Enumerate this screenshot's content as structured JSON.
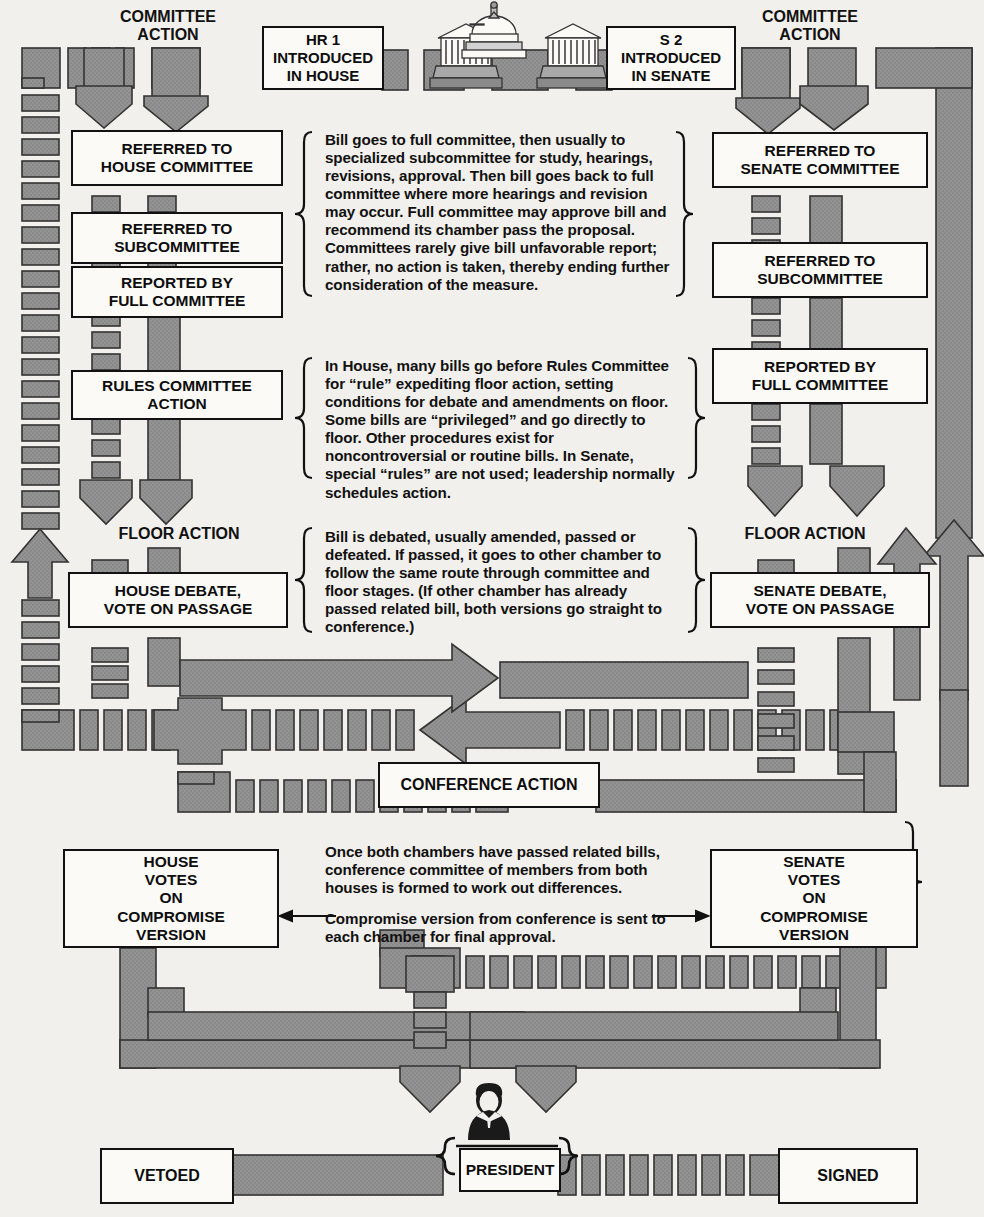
{
  "diagram": {
    "colors": {
      "track": "#8f8f8f",
      "track_stroke": "#3a3a3a",
      "box_fill": "#fbfaf7",
      "box_stroke": "#111111",
      "page": "#f2f0ec"
    }
  },
  "labels": {
    "committee_action_left": "COMMITTEE\nACTION",
    "committee_action_right": "COMMITTEE\nACTION",
    "floor_action_left": "FLOOR ACTION",
    "floor_action_right": "FLOOR ACTION"
  },
  "boxes": {
    "hr1": "HR 1\nINTRODUCED\nIN HOUSE",
    "s2": "S 2\nINTRODUCED\nIN SENATE",
    "referred_house_committee": "REFERRED TO\nHOUSE COMMITTEE",
    "referred_subcommittee_house": "REFERRED TO\nSUBCOMMITTEE",
    "reported_full_committee_house": "REPORTED BY\nFULL COMMITTEE",
    "rules_committee_action": "RULES COMMITTEE\nACTION",
    "house_debate": "HOUSE DEBATE,\nVOTE ON PASSAGE",
    "referred_senate_committee": "REFERRED TO\nSENATE COMMITTEE",
    "referred_subcommittee_senate": "REFERRED TO\nSUBCOMMITTEE",
    "reported_full_committee_senate": "REPORTED BY\nFULL COMMITTEE",
    "senate_debate": "SENATE DEBATE,\nVOTE ON PASSAGE",
    "conference_action": "CONFERENCE ACTION",
    "house_votes_compromise": "HOUSE\nVOTES\nON\nCOMPROMISE\nVERSION",
    "senate_votes_compromise": "SENATE\nVOTES\nON\nCOMPROMISE\nVERSION",
    "president": "PRESIDENT",
    "vetoed": "VETOED",
    "signed": "SIGNED"
  },
  "notes": {
    "committee": "Bill goes to full committee, then usually to specialized subcommittee for study, hearings, revisions, approval. Then bill goes back to full committee where more hearings and revision may occur. Full committee may approve bill and recommend its chamber pass the proposal. Committees rarely give bill unfavorable report; rather, no action is taken, thereby ending further consideration of the measure.",
    "rules": "In House, many bills go before Rules Committee for “rule” expediting floor action, setting conditions for debate and amendments on floor. Some bills are “privileged” and go directly to floor. Other procedures exist for noncontroversial or routine bills. In Senate, special “rules” are not used; leadership normally schedules action.",
    "floor": "Bill is debated, usually amended, passed or defeated. If passed, it goes to other chamber to follow the same route through committee and floor stages. (If other chamber has already passed related bill, both versions go straight to conference.)",
    "conference_1": "Once both chambers have passed related bills, conference committee of members from both houses is formed to work out differences.",
    "conference_2": "Compromise version from conference is sent to each chamber for final approval."
  },
  "icons": {
    "capitol": "capitol-building-icon",
    "president_figure": "president-figure-icon"
  }
}
